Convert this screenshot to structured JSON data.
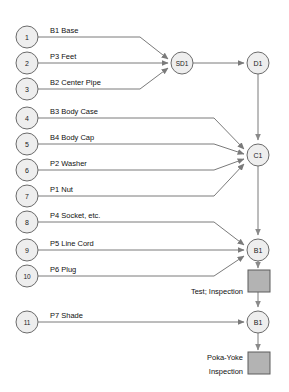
{
  "diagram": {
    "colors": {
      "node_fill": "#eeeeee",
      "node_stroke": "#6b6b6b",
      "edge": "#7a7a7a",
      "inspection_fill": "#b3b3b3",
      "inspection_stroke": "#5c5c5c",
      "text": "#111111",
      "background": "#ffffff"
    },
    "part_nodes": [
      {
        "id": "1",
        "label": "1",
        "part": "B1 Base",
        "cx": 27,
        "cy": 37,
        "target": "SD1"
      },
      {
        "id": "2",
        "label": "2",
        "part": "P3 Feet",
        "cx": 27,
        "cy": 63,
        "target": "SD1"
      },
      {
        "id": "3",
        "label": "3",
        "part": "B2 Center Pipe",
        "cx": 27,
        "cy": 89,
        "target": "SD1"
      },
      {
        "id": "4",
        "label": "4",
        "part": "B3 Body Case",
        "cx": 27,
        "cy": 118,
        "target": "C1"
      },
      {
        "id": "5",
        "label": "5",
        "part": "B4 Body Cap",
        "cx": 27,
        "cy": 144,
        "target": "C1"
      },
      {
        "id": "6",
        "label": "6",
        "part": "P2 Washer",
        "cx": 27,
        "cy": 170,
        "target": "C1"
      },
      {
        "id": "7",
        "label": "7",
        "part": "P1 Nut",
        "cx": 27,
        "cy": 196,
        "target": "C1"
      },
      {
        "id": "8",
        "label": "8",
        "part": "P4 Socket, etc.",
        "cx": 27,
        "cy": 222,
        "target": "B1-upper"
      },
      {
        "id": "9",
        "label": "9",
        "part": "P5 Line Cord",
        "cx": 27,
        "cy": 250,
        "target": "B1-upper"
      },
      {
        "id": "10",
        "label": "10",
        "part": "P6 Plug",
        "cx": 27,
        "cy": 276,
        "target": "B1-upper"
      },
      {
        "id": "11",
        "label": "11",
        "part": "P7 Shade",
        "cx": 27,
        "cy": 322,
        "target": "B1-lower"
      }
    ],
    "operation_nodes": [
      {
        "id": "SD1",
        "label": "SD1",
        "cx": 182,
        "cy": 63
      },
      {
        "id": "D1",
        "label": "D1",
        "cx": 258,
        "cy": 63
      },
      {
        "id": "C1",
        "label": "C1",
        "cx": 258,
        "cy": 155
      },
      {
        "id": "B1-upper",
        "label": "B1",
        "cx": 258,
        "cy": 250
      },
      {
        "id": "B1-lower",
        "label": "B1",
        "cx": 258,
        "cy": 322
      }
    ],
    "inspection_boxes": [
      {
        "id": "test-inspection",
        "label": "Test; Inspection",
        "x": 248,
        "y": 270,
        "w": 22,
        "h": 22
      },
      {
        "id": "poka-yoke-inspection",
        "label": "Poka-Yoke\nInspection",
        "x": 248,
        "y": 352,
        "w": 22,
        "h": 22
      }
    ],
    "inspection_labels": [
      {
        "id": "test-inspection-label",
        "lines": [
          "Test; Inspection"
        ],
        "x": 243,
        "y": 294
      },
      {
        "id": "poka-yoke-inspection-label",
        "lines": [
          "Poka-Yoke",
          "Inspection"
        ],
        "x": 243,
        "y": 360
      }
    ],
    "vertical_flow": [
      {
        "from": "SD1",
        "to": "D1"
      },
      {
        "from": "D1",
        "to": "C1"
      },
      {
        "from": "C1",
        "to": "B1-upper"
      },
      {
        "from": "B1-upper",
        "to": "test-inspection"
      },
      {
        "from": "test-inspection",
        "to": "B1-lower"
      },
      {
        "from": "B1-lower",
        "to": "poka-yoke-inspection"
      }
    ]
  }
}
